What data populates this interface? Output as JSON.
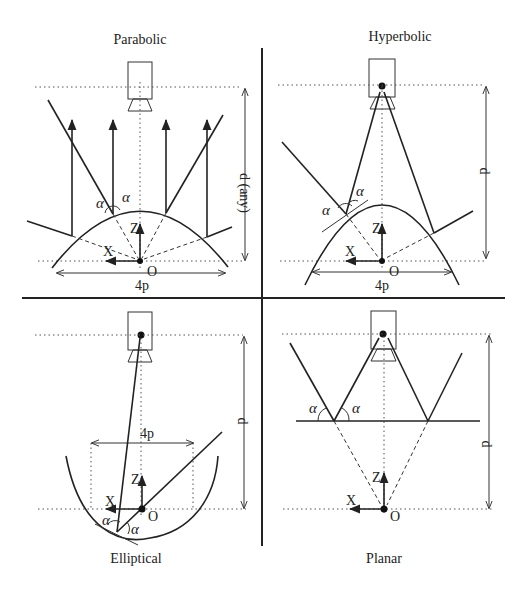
{
  "figure": {
    "panels": [
      {
        "id": "parabolic",
        "title": "Parabolic",
        "dimension_label": "d (any)",
        "width_label": "4p",
        "axis_z": "Z",
        "axis_x": "X",
        "origin": "O",
        "angle": "α"
      },
      {
        "id": "hyperbolic",
        "title": "Hyperbolic",
        "dimension_label": "d",
        "width_label": "4p",
        "axis_z": "Z",
        "axis_x": "X",
        "origin": "O",
        "angle": "α"
      },
      {
        "id": "elliptical",
        "title": "Elliptical",
        "dimension_label": "d",
        "width_label": "4p",
        "axis_z": "Z",
        "axis_x": "X",
        "origin": "O",
        "angle": "α"
      },
      {
        "id": "planar",
        "title": "Planar",
        "dimension_label": "d",
        "axis_z": "Z",
        "axis_x": "X",
        "origin": "O",
        "angle": "α"
      }
    ]
  }
}
